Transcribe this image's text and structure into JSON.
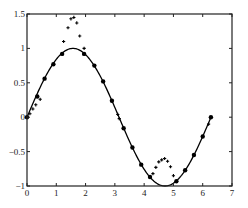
{
  "chart_data": {
    "type": "line",
    "title": "",
    "xlabel": "",
    "ylabel": "",
    "xlim": [
      0,
      7
    ],
    "ylim": [
      -1,
      1.5
    ],
    "grid": false,
    "legend": null,
    "x_ticks": [
      "0",
      "1",
      "2",
      "3",
      "4",
      "5",
      "6",
      "7"
    ],
    "y_ticks": [
      "-1",
      "-0.5",
      "0",
      "0.5",
      "1",
      "1.5"
    ],
    "series": [
      {
        "name": "sin(x)",
        "style": "solid line",
        "color": "#000000",
        "function": "sin(x)",
        "x_range": [
          0,
          6.283
        ]
      },
      {
        "name": "samples (dots)",
        "style": "filled circle markers",
        "color": "#000000",
        "points": [
          [
            0.0,
            0.0
          ],
          [
            0.35,
            0.3
          ],
          [
            0.6,
            0.56
          ],
          [
            0.9,
            0.77
          ],
          [
            1.2,
            0.92
          ],
          [
            1.95,
            0.92
          ],
          [
            2.3,
            0.75
          ],
          [
            2.6,
            0.52
          ],
          [
            2.9,
            0.24
          ],
          [
            3.3,
            -0.16
          ],
          [
            3.6,
            -0.44
          ],
          [
            3.9,
            -0.69
          ],
          [
            4.2,
            -0.87
          ],
          [
            5.1,
            -0.93
          ],
          [
            5.4,
            -0.77
          ],
          [
            5.7,
            -0.55
          ],
          [
            6.0,
            -0.28
          ],
          [
            6.28,
            0.0
          ]
        ]
      },
      {
        "name": "samples (crosses)",
        "style": "plus markers",
        "color": "#000000",
        "points": [
          [
            0.1,
            0.05
          ],
          [
            0.2,
            0.12
          ],
          [
            0.3,
            0.18
          ],
          [
            0.45,
            0.26
          ],
          [
            1.25,
            1.1
          ],
          [
            1.4,
            1.3
          ],
          [
            1.5,
            1.43
          ],
          [
            1.6,
            1.45
          ],
          [
            1.7,
            1.37
          ],
          [
            1.8,
            1.18
          ],
          [
            1.95,
            1.0
          ],
          [
            3.1,
            0.04
          ],
          [
            3.15,
            -0.02
          ],
          [
            4.3,
            -0.82
          ],
          [
            4.4,
            -0.73
          ],
          [
            4.5,
            -0.65
          ],
          [
            4.6,
            -0.62
          ],
          [
            4.7,
            -0.6
          ],
          [
            4.8,
            -0.64
          ],
          [
            4.9,
            -0.72
          ],
          [
            5.0,
            -0.85
          ],
          [
            6.2,
            -0.1
          ]
        ]
      }
    ]
  }
}
